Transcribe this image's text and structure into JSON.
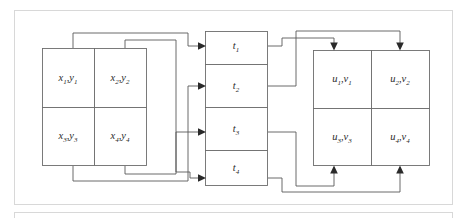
{
  "figure": {
    "title": "",
    "type": "block-interconnect-diagram",
    "outer_frame": {
      "name": "figure-frame"
    },
    "second_frame": {
      "name": "next-figure-frame-top-edge"
    }
  },
  "blocks": {
    "left": {
      "name": "source-matrix-block",
      "cells": [
        {
          "id": "x1y1",
          "base1": "x",
          "sub1": "1",
          "sep": ",",
          "base2": "y",
          "sub2": "1"
        },
        {
          "id": "x2y2",
          "base1": "x",
          "sub1": "2",
          "sep": ",",
          "base2": "y",
          "sub2": "2"
        },
        {
          "id": "x3y3",
          "base1": "x",
          "sub1": "3",
          "sep": ",",
          "base2": "y",
          "sub2": "3"
        },
        {
          "id": "x4y4",
          "base1": "x",
          "sub1": "4",
          "sep": ",",
          "base2": "y",
          "sub2": "4"
        }
      ]
    },
    "middle": {
      "name": "t-register-column",
      "cells": [
        {
          "id": "t1",
          "base1": "t",
          "sub1": "1"
        },
        {
          "id": "t2",
          "base1": "t",
          "sub1": "2"
        },
        {
          "id": "t3",
          "base1": "t",
          "sub1": "3"
        },
        {
          "id": "t4",
          "base1": "t",
          "sub1": "4"
        }
      ]
    },
    "right": {
      "name": "destination-matrix-block",
      "cells": [
        {
          "id": "u1v1",
          "base1": "u",
          "sub1": "1",
          "sep": ",",
          "base2": "v",
          "sub2": "1"
        },
        {
          "id": "u2v2",
          "base1": "u",
          "sub1": "2",
          "sep": ",",
          "base2": "v",
          "sub2": "2"
        },
        {
          "id": "u3v3",
          "base1": "u",
          "sub1": "3",
          "sep": ",",
          "base2": "v",
          "sub2": "3"
        },
        {
          "id": "u4v4",
          "base1": "u",
          "sub1": "4",
          "sep": ",",
          "base2": "v",
          "sub2": "4"
        }
      ]
    }
  },
  "colors": {
    "frame_stroke": "#d8d8d8",
    "box_stroke": "#6d6d6d",
    "wire_stroke": "#5a5a5a",
    "arrow_fill": "#2a2a2a",
    "background": "#ffffff",
    "text": "#2b2b2b"
  },
  "wires": {
    "left_to_t": [
      {
        "name": "wire-x1-to-t1",
        "from": "x1y1",
        "to": "t1"
      },
      {
        "name": "wire-x2-to-t4",
        "from": "x2y2",
        "to": "t4"
      },
      {
        "name": "wire-x3-to-t2",
        "from": "x3y3",
        "to": "t2"
      },
      {
        "name": "wire-x4-to-t3",
        "from": "x4y4",
        "to": "t3"
      }
    ],
    "t_to_right": [
      {
        "name": "wire-t1-to-u1",
        "from": "t1",
        "to": "u1v1"
      },
      {
        "name": "wire-t2-to-u2",
        "from": "t2",
        "to": "u2v2"
      },
      {
        "name": "wire-t3-to-u3",
        "from": "t3",
        "to": "u3v3"
      },
      {
        "name": "wire-t4-to-u4",
        "from": "t4",
        "to": "u4v4"
      }
    ]
  }
}
